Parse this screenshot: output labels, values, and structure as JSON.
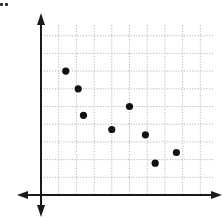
{
  "chart_data": {
    "type": "scatter",
    "title": "",
    "xlabel": "",
    "ylabel": "",
    "xlim": [
      0,
      10
    ],
    "ylim": [
      0,
      10
    ],
    "grid": true,
    "grid_style": "dotted",
    "x_tick_labels": [],
    "y_tick_labels": [],
    "legend": null,
    "axes_arrows": true,
    "points": [
      {
        "x": 1.4,
        "y": 7.0
      },
      {
        "x": 2.1,
        "y": 6.0
      },
      {
        "x": 2.4,
        "y": 4.5
      },
      {
        "x": 4.0,
        "y": 3.7
      },
      {
        "x": 5.0,
        "y": 5.0
      },
      {
        "x": 5.9,
        "y": 3.4
      },
      {
        "x": 6.45,
        "y": 1.8
      },
      {
        "x": 7.65,
        "y": 2.4
      }
    ],
    "x": [
      1.4,
      2.1,
      2.4,
      4.0,
      5.0,
      5.9,
      6.45,
      7.65
    ],
    "y": [
      7.0,
      6.0,
      4.5,
      3.7,
      5.0,
      3.4,
      1.8,
      2.4
    ]
  },
  "style": {
    "axis_color": "#1a1a1a",
    "grid_color": "#b5b5b5",
    "point_color": "#111111"
  },
  "layout": {
    "origin_px": [
      41,
      195
    ],
    "unit_px": 17.7,
    "grid_lines": 9,
    "grid_extent_units": [
      9.8,
      9.6
    ]
  }
}
